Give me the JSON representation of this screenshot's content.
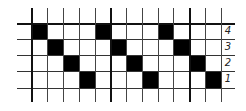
{
  "diagram": {
    "type": "weave-draft-grid",
    "columns": 12,
    "rows": 4,
    "row_labels": [
      "4",
      "3",
      "2",
      "1"
    ],
    "filled_cells": [
      {
        "row": 0,
        "col": 0
      },
      {
        "row": 0,
        "col": 4
      },
      {
        "row": 0,
        "col": 8
      },
      {
        "row": 1,
        "col": 1
      },
      {
        "row": 1,
        "col": 5
      },
      {
        "row": 1,
        "col": 9
      },
      {
        "row": 2,
        "col": 2
      },
      {
        "row": 2,
        "col": 6
      },
      {
        "row": 2,
        "col": 10
      },
      {
        "row": 3,
        "col": 3
      },
      {
        "row": 3,
        "col": 7
      },
      {
        "row": 3,
        "col": 11
      }
    ],
    "fill_color": "#000000",
    "line_color": "#333333",
    "background": "#ffffff"
  }
}
